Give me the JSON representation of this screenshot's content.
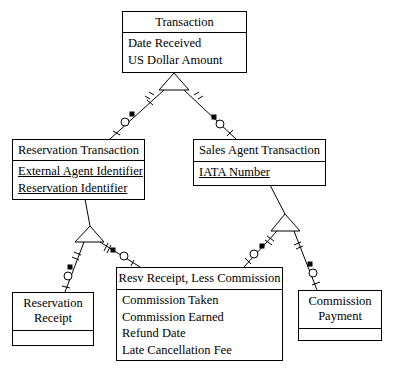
{
  "entities": {
    "transaction": {
      "name": "Transaction",
      "attributes": [
        "Date Received",
        "US Dollar Amount"
      ]
    },
    "reservation_transaction": {
      "name": "Reservation Transaction",
      "attributes": [
        "External Agent Identifier",
        "Reservation Identifier"
      ],
      "key_attributes": true
    },
    "sales_agent_transaction": {
      "name": "Sales Agent Transaction",
      "attributes": [
        "IATA Number"
      ],
      "key_attributes": true
    },
    "reservation_receipt": {
      "name_line1": "Reservation",
      "name_line2": "Receipt",
      "attributes": []
    },
    "resv_receipt_less_commission": {
      "name": "Resv Receipt, Less Commission",
      "attributes": [
        "Commission Taken",
        "Commission Earned",
        "Refund Date",
        "Late Cancellation Fee"
      ]
    },
    "commission_payment": {
      "name_line1": "Commission",
      "name_line2": "Payment",
      "attributes": []
    }
  },
  "relationships": [
    {
      "parent": "Transaction",
      "subtypes": [
        "Reservation Transaction",
        "Sales Agent Transaction"
      ],
      "symbol": "subtype-triangle"
    },
    {
      "parent": "Reservation Transaction",
      "subtypes": [
        "Reservation Receipt",
        "Resv Receipt, Less Commission"
      ],
      "symbol": "subtype-triangle"
    },
    {
      "parent": "Sales Agent Transaction",
      "subtypes": [
        "Resv Receipt, Less Commission",
        "Commission Payment"
      ],
      "symbol": "subtype-triangle"
    }
  ]
}
